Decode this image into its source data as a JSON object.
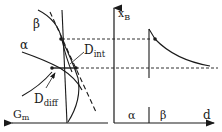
{
  "left_panel": {
    "x_axis_label": "G",
    "x_axis_sub": "m",
    "curve_beta_label": "β",
    "curve_alpha_label": "α",
    "annot_int": "D",
    "annot_int_sub": "int",
    "annot_diff": "D",
    "annot_diff_sub": "diff"
  },
  "right_panel": {
    "y_axis_label": "x",
    "y_axis_sub": "B",
    "x_axis_label": "d",
    "region_alpha": "α",
    "region_beta": "β"
  },
  "colors": {
    "ink": "#1a1a1a",
    "background": "#ffffff"
  }
}
